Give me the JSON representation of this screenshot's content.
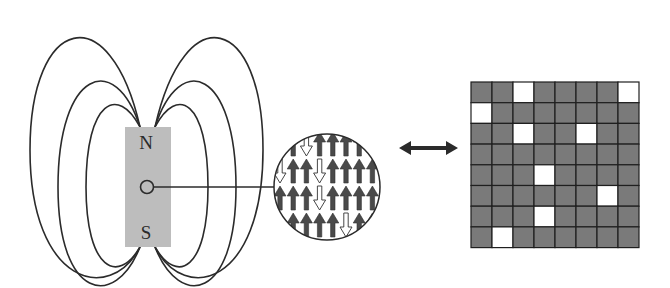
{
  "figure": {
    "magnet": {
      "north_label": "N",
      "south_label": "S",
      "fill_color": "#bdbdbd"
    },
    "field_lines": {
      "count_per_side": 3,
      "stroke_color": "#2b2b2b"
    },
    "domain_circle": {
      "rows": [
        [
          "up",
          "up",
          "down",
          "up",
          "up",
          "up",
          "up",
          "up"
        ],
        [
          "down",
          "up",
          "up",
          "down",
          "up",
          "up",
          "up",
          "up"
        ],
        [
          "up",
          "up",
          "up",
          "down",
          "up",
          "up",
          "up",
          "up"
        ],
        [
          "up",
          "up",
          "up",
          "up",
          "up",
          "down",
          "up",
          "up"
        ]
      ],
      "up_color": "#4a4a4a",
      "down_color": "#ffffff"
    },
    "connector": {
      "type": "double-headed-arrow",
      "color": "#2b2b2b"
    },
    "grid": {
      "rows": 8,
      "cols": 8,
      "filled_color": "#7a7a7a",
      "empty_color": "#ffffff",
      "line_color": "#1f1f1f",
      "cells": [
        [
          1,
          1,
          0,
          1,
          1,
          1,
          1,
          0
        ],
        [
          0,
          1,
          1,
          1,
          1,
          1,
          1,
          1
        ],
        [
          1,
          1,
          0,
          1,
          1,
          0,
          1,
          1
        ],
        [
          1,
          1,
          1,
          1,
          1,
          1,
          1,
          1
        ],
        [
          1,
          1,
          1,
          0,
          1,
          1,
          1,
          1
        ],
        [
          1,
          1,
          1,
          1,
          1,
          1,
          0,
          1
        ],
        [
          1,
          1,
          1,
          0,
          1,
          1,
          1,
          1
        ],
        [
          1,
          0,
          1,
          1,
          1,
          1,
          1,
          1
        ]
      ]
    }
  }
}
